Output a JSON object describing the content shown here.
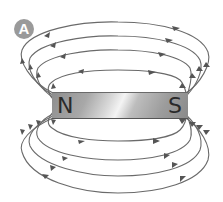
{
  "figure": {
    "label": "A"
  },
  "magnet": {
    "north_label": "N",
    "south_label": "S"
  },
  "field_lines": {
    "count_above": 4,
    "count_below": 4,
    "direction": "N to S (outside magnet)",
    "color": "#555555"
  }
}
